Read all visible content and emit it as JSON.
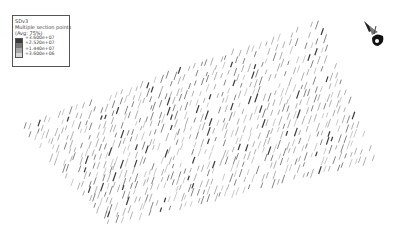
{
  "legend": {
    "variable": "SDv3",
    "line2": "Multiple section points",
    "line3": "(Avg: 75%)",
    "entries": [
      {
        "label": "+3.600e+07",
        "color": "#3a3a3a"
      },
      {
        "label": "+2.520e+07",
        "color": "#777777"
      },
      {
        "label": "+1.440e+07",
        "color": "#a8a8a8"
      },
      {
        "label": "+3.600e+06",
        "color": "#d6d6d6"
      }
    ]
  },
  "triad": {
    "icon": "axis-triad-icon"
  },
  "mesh": {
    "corners": {
      "top_left": [
        25,
        127
      ],
      "top_right": [
        318,
        24
      ],
      "bottom_right": [
        372,
        158
      ],
      "bottom_left": [
        110,
        222
      ]
    },
    "cols": 46,
    "rows": 17,
    "mark_length": 7,
    "mark_slant": 1.2,
    "colors": [
      "#3a3a3a",
      "#777777",
      "#a8a8a8",
      "#c4c4c4"
    ]
  }
}
